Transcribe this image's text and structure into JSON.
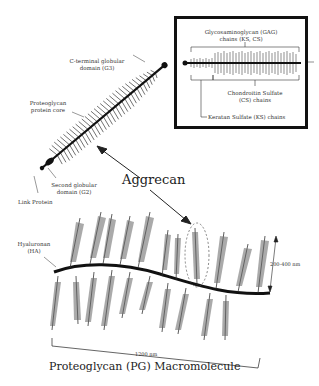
{
  "inset": {
    "gag_label_line1": "Glycosaminoglycan (GAG)",
    "gag_label_line2": "chains (KS, CS)",
    "cs_label_line1": "Chondroitin Sulfate",
    "cs_label_line2": "(CS) chains",
    "ks_label": "Keratan Sulfate (KS) chains"
  },
  "aggrecan": {
    "c_terminal_line1": "C-terminal globular",
    "c_terminal_line2": "domain (G3)",
    "core_line1": "Proteoglycan",
    "core_line2": "protein core",
    "g2_line1": "Second globular",
    "g2_line2": "domain (G2)",
    "link_protein": "Link Protein",
    "name": "Aggrecan"
  },
  "macromolecule": {
    "ha_line1": "Hyaluronan",
    "ha_line2": "(HA)",
    "height_label": "200-400 nm",
    "length_label": "1200 nm",
    "title": "Proteoglycan (PG) Macromolecule"
  },
  "colors": {
    "ink": "#111111",
    "bristle": "#555555",
    "text": "#333333"
  }
}
